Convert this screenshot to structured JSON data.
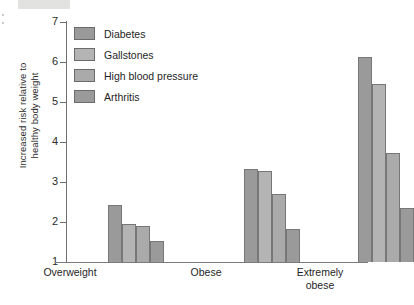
{
  "chart_data": {
    "type": "bar",
    "title": "",
    "xlabel": "",
    "ylabel": "Increased risk relative to healthy body weight",
    "ylabel_line1": "Increased risk relative to",
    "ylabel_line2": "healthy body weight",
    "ylim": [
      1,
      7
    ],
    "yticks": [
      1,
      2,
      3,
      4,
      5,
      6,
      7
    ],
    "ytick_labels": [
      "1",
      "2",
      "3",
      "4",
      "5",
      "6",
      "7"
    ],
    "grid": false,
    "legend_position": "upper-left-inside",
    "categories": [
      "Overweight",
      "Obese",
      "Extremely obese"
    ],
    "category_labels": [
      {
        "line1": "Overweight",
        "line2": ""
      },
      {
        "line1": "Obese",
        "line2": ""
      },
      {
        "line1": "Extremely",
        "line2": "obese"
      }
    ],
    "series": [
      {
        "name": "Diabetes",
        "color": "#9a9a9a",
        "values": [
          2.42,
          3.32,
          6.13
        ]
      },
      {
        "name": "Gallstones",
        "color": "#b4b4b4",
        "values": [
          1.95,
          3.27,
          5.45
        ]
      },
      {
        "name": "High blood pressure",
        "color": "#aaaaaa",
        "values": [
          1.91,
          2.71,
          3.72
        ]
      },
      {
        "name": "Arthritis",
        "color": "#9a9a9a",
        "values": [
          1.52,
          1.83,
          2.34
        ]
      }
    ]
  },
  "legend": {
    "items": [
      {
        "label": "Diabetes",
        "color": "#9a9a9a"
      },
      {
        "label": "Gallstones",
        "color": "#b4b4b4"
      },
      {
        "label": "High blood pressure",
        "color": "#aaaaaa"
      },
      {
        "label": "Arthritis",
        "color": "#9a9a9a"
      }
    ]
  }
}
